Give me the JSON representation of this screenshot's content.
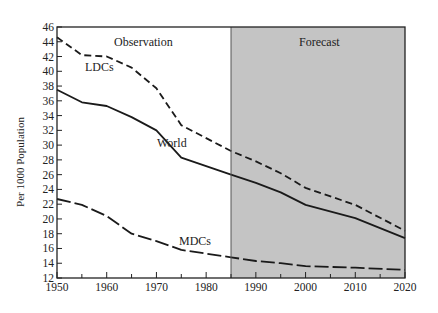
{
  "chart_data": {
    "type": "line",
    "title": "",
    "xlabel": "",
    "ylabel": "Per 1000 Population",
    "xlim": [
      1950,
      2020
    ],
    "ylim": [
      12,
      46
    ],
    "x_ticks": [
      1950,
      1960,
      1970,
      1980,
      1990,
      2000,
      2010,
      2020
    ],
    "x_minor_ticks": [
      1955,
      1965,
      1975,
      1985,
      1995,
      2005,
      2015
    ],
    "y_ticks": [
      12,
      14,
      16,
      18,
      20,
      22,
      24,
      26,
      28,
      30,
      32,
      34,
      36,
      38,
      40,
      42,
      44,
      46
    ],
    "grid": false,
    "legend": "none (inline series labels)",
    "regions": [
      {
        "name": "Observation",
        "from": 1950,
        "to": 1985,
        "fill": "#ffffff"
      },
      {
        "name": "Forecast",
        "from": 1985,
        "to": 2020,
        "fill": "#c4c4c4"
      }
    ],
    "series": [
      {
        "name": "LDCs",
        "style": "dashed",
        "x": [
          1950,
          1955,
          1960,
          1965,
          1970,
          1975,
          1985,
          1990,
          1995,
          2000,
          2010,
          2020
        ],
        "values": [
          44.6,
          42.2,
          42.0,
          40.5,
          37.7,
          32.7,
          29.2,
          27.8,
          26.2,
          24.2,
          21.9,
          18.4
        ]
      },
      {
        "name": "World",
        "style": "solid",
        "x": [
          1950,
          1955,
          1960,
          1965,
          1970,
          1975,
          1985,
          1990,
          1995,
          2000,
          2010,
          2020
        ],
        "values": [
          37.5,
          35.8,
          35.3,
          33.8,
          32.0,
          28.3,
          26.0,
          24.9,
          23.6,
          21.9,
          20.1,
          17.4
        ]
      },
      {
        "name": "MDCs",
        "style": "long-dashed",
        "x": [
          1950,
          1955,
          1960,
          1965,
          1970,
          1975,
          1985,
          1990,
          1995,
          2000,
          2010,
          2020
        ],
        "values": [
          22.7,
          21.9,
          20.4,
          18.0,
          17.0,
          15.8,
          14.8,
          14.3,
          14.0,
          13.6,
          13.4,
          13.1
        ]
      }
    ],
    "annotations": [
      {
        "text": "Observation",
        "x": 1961,
        "y": 44
      },
      {
        "text": "Forecast",
        "x": 1997,
        "y": 44
      },
      {
        "text": "LDCs",
        "x": 1956,
        "y": 40.3
      },
      {
        "text": "World",
        "x": 1970,
        "y": 30.2
      },
      {
        "text": "MDCs",
        "x": 1976,
        "y": 16.2
      }
    ]
  },
  "labels": {
    "ylabel": "Per 1000 Population",
    "observation": "Observation",
    "forecast": "Forecast",
    "ldcs": "LDCs",
    "world": "World",
    "mdcs": "MDCs"
  },
  "colors": {
    "forecast_fill": "#c4c4c4",
    "line": "#1a1a1a",
    "axis": "#222222"
  }
}
